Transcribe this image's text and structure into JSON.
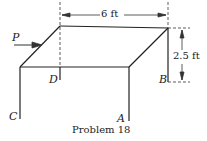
{
  "figure": {
    "caption": "Problem 18",
    "labels": {
      "P": "P",
      "A": "A",
      "B": "B",
      "C": "C",
      "D": "D"
    },
    "dimensions": {
      "width": "6 ft",
      "height": "2.5 ft"
    }
  }
}
